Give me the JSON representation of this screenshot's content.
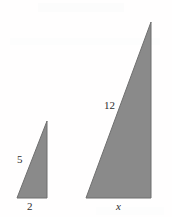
{
  "figure": {
    "background_color": "#fffefe",
    "fill_color": "#8a8a8a",
    "edge_color": "#6f6f6f",
    "label_color": "#2e2e2e",
    "shapes": [
      {
        "name": "small-triangle",
        "points": "17,198 47,198 47,121",
        "right_angle_corner": "bottom-right",
        "labels": {
          "hypotenuse": "5",
          "base": "2"
        }
      },
      {
        "name": "large-triangle",
        "points": "86,198 151,198 151,22",
        "right_angle_corner": "bottom-right",
        "labels": {
          "hypotenuse": "12",
          "base": "x"
        }
      }
    ]
  },
  "labels": {
    "small_hypotenuse": "5",
    "small_base": "2",
    "large_hypotenuse": "12",
    "large_base": "x"
  }
}
